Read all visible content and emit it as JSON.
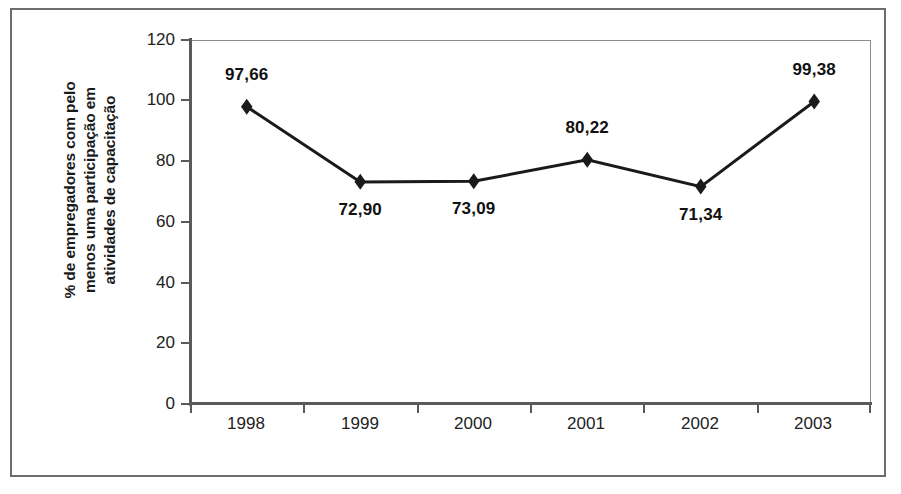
{
  "chart_data": {
    "type": "line",
    "title": "",
    "subtitle": "",
    "xlabel": "",
    "ylabel": "% de empregadores com pelo menos uma participação em atividades de capacitação",
    "ylabel_lines": [
      "% de empregadores com pelo",
      "menos uma participação em",
      "atividades de capacitação"
    ],
    "categories": [
      "1998",
      "1999",
      "2000",
      "2001",
      "2002",
      "2003"
    ],
    "values": [
      97.66,
      72.9,
      73.09,
      80.22,
      71.34,
      99.38
    ],
    "point_labels": [
      "97,66",
      "72,90",
      "73,09",
      "80,22",
      "71,34",
      "99,38"
    ],
    "label_positions": [
      "above",
      "below",
      "below",
      "above",
      "below",
      "above"
    ],
    "ylim": [
      0,
      120
    ],
    "ytick_values": [
      0,
      20,
      40,
      60,
      80,
      100,
      120
    ],
    "ytick_labels": [
      "0",
      "20",
      "40",
      "60",
      "80",
      "100",
      "120"
    ],
    "grid": false,
    "legend": "none",
    "marker": "diamond",
    "series_color": "#1a1a1a",
    "axis_color": "#5a5a5a",
    "plot_background": "#ffffff",
    "frame_color": "#6e6e6e"
  }
}
